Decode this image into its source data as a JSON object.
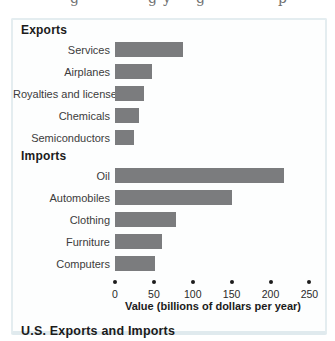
{
  "top_fragment": {
    "letters": [
      "g",
      "g",
      "y",
      "g",
      "p"
    ],
    "note_color": "#6f6f6f"
  },
  "figure": {
    "title": "U.S. Exports and Imports",
    "xlabel": "Value (billions of dollars per year)"
  },
  "chart_data": {
    "type": "bar",
    "orientation": "horizontal",
    "title": "U.S. Exports and Imports",
    "xlabel": "Value (billions of dollars per year)",
    "xlim": [
      0,
      250
    ],
    "x_ticks": [
      0,
      50,
      100,
      150,
      200,
      250
    ],
    "grid": false,
    "legend": "none",
    "bar_color": "#7b7c7e",
    "tick_dot_color": "#1c1c1c",
    "groups": [
      {
        "label": "Exports",
        "items": [
          {
            "label": "Services",
            "value": 88
          },
          {
            "label": "Airplanes",
            "value": 47
          },
          {
            "label": "Royalties and licenses",
            "value": 37
          },
          {
            "label": "Chemicals",
            "value": 31
          },
          {
            "label": "Semiconductors",
            "value": 25
          }
        ]
      },
      {
        "label": "Imports",
        "items": [
          {
            "label": "Oil",
            "value": 217
          },
          {
            "label": "Automobiles",
            "value": 151
          },
          {
            "label": "Clothing",
            "value": 79
          },
          {
            "label": "Furniture",
            "value": 60
          },
          {
            "label": "Computers",
            "value": 52
          }
        ]
      }
    ]
  }
}
